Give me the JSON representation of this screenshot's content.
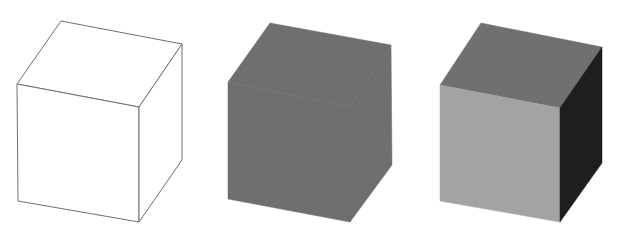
{
  "figure": {
    "background": "#ffffff",
    "cubes": [
      {
        "id": "wireframe",
        "style": "outline",
        "stroke": "#707070",
        "faces": {
          "top": {
            "points": "61,21 182,44 139,107 17,84",
            "fill": "#ffffff"
          },
          "front": {
            "points": "17,84 139,107 139,222 18,201",
            "fill": "#ffffff"
          },
          "right": {
            "points": "139,107 182,44 182,160 139,222",
            "fill": "#ffffff"
          }
        }
      },
      {
        "id": "flat-shaded",
        "style": "silhouette",
        "stroke": "none",
        "faces": {
          "top": {
            "points": "270,23 391,45 350,107 228,82",
            "fill": "#6f6f6f"
          },
          "front": {
            "points": "228,82 350,107 350,222 228,199",
            "fill": "#6f6f6f"
          },
          "right": {
            "points": "350,107 391,45 392,165 350,222",
            "fill": "#6f6f6f"
          }
        }
      },
      {
        "id": "lit-shaded",
        "style": "shaded",
        "stroke": "none",
        "faces": {
          "top": {
            "points": "481,23 602,47 560,108 440,85",
            "fill": "#707070"
          },
          "front": {
            "points": "440,85 560,108 560,222 440,201",
            "fill": "#a3a3a3"
          },
          "right": {
            "points": "560,108 602,47 602,163 560,222",
            "fill": "#1e1e1e"
          }
        }
      }
    ]
  }
}
